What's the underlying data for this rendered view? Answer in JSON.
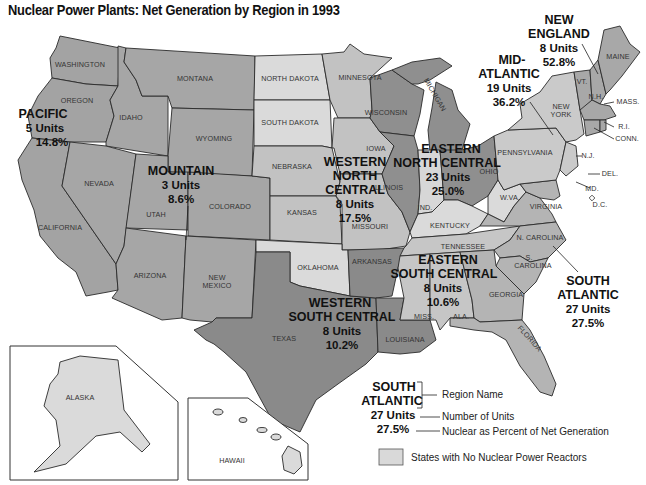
{
  "title": "Nuclear Power Plants: Net Generation by Region in 1993",
  "colors": {
    "region_dark": "#8a8a8a",
    "region_medium": "#a6a6a6",
    "region_light": "#bebebe",
    "no_reactors": "#d9d9d9",
    "border": "#2a2a2a",
    "background": "#ffffff"
  },
  "regions": [
    {
      "name": "PACIFIC",
      "units": "5 Units",
      "percent": "14.8%"
    },
    {
      "name": "MOUNTAIN",
      "units": "3 Units",
      "percent": "8.6%"
    },
    {
      "name_lines": [
        "WESTERN",
        "NORTH",
        "CENTRAL"
      ],
      "units": "8 Units",
      "percent": "17.5%"
    },
    {
      "name_lines": [
        "WESTERN",
        "SOUTH  CENTRAL"
      ],
      "units": "8 Units",
      "percent": "10.2%"
    },
    {
      "name_lines": [
        "EASTERN",
        "NORTH CENTRAL"
      ],
      "units": "23 Units",
      "percent": "25.0%"
    },
    {
      "name_lines": [
        "EASTERN",
        "SOUTH CENTRAL"
      ],
      "units": "8 Units",
      "percent": "10.6%"
    },
    {
      "name_lines": [
        "SOUTH",
        "ATLANTIC"
      ],
      "units": "27 Units",
      "percent": "27.5%"
    },
    {
      "name_lines": [
        "MID-",
        "ATLANTIC"
      ],
      "units": "19 Units",
      "percent": "36.2%"
    },
    {
      "name_lines": [
        "NEW",
        "ENGLAND"
      ],
      "units": "8 Units",
      "percent": "52.8%"
    }
  ],
  "states": {
    "washington": "WASHINGTON",
    "oregon": "OREGON",
    "california": "CALIFORNIA",
    "idaho": "IDAHO",
    "nevada": "NEVADA",
    "montana": "MONTANA",
    "wyoming": "WYOMING",
    "utah": "UTAH",
    "colorado": "COLORADO",
    "arizona": "ARIZONA",
    "new_mexico_1": "NEW",
    "new_mexico_2": "MEXICO",
    "north_dakota": "NORTH DAKOTA",
    "south_dakota": "SOUTH DAKOTA",
    "nebraska": "NEBRASKA",
    "kansas": "KANSAS",
    "oklahoma": "OKLAHOMA",
    "texas": "TEXAS",
    "minnesota": "MINNESOTA",
    "iowa": "IOWA",
    "missouri": "MISSOURI",
    "arkansas": "ARKANSAS",
    "louisiana": "LOUISIANA",
    "wisconsin": "WISCONSIN",
    "michigan": "MICHIGAN",
    "illinois": "ILLINOIS",
    "indiana": "IND.",
    "ohio": "OHIO",
    "kentucky": "KENTUCKY",
    "tennessee": "TENNESSEE",
    "mississippi": "MISS.",
    "alabama": "ALA.",
    "georgia": "GEORGIA",
    "florida": "FLORIDA",
    "south_carolina_1": "S.",
    "south_carolina_2": "CAROLINA",
    "north_carolina": "N. CAROLINA",
    "virginia": "VIRGINIA",
    "west_virginia": "W.VA.",
    "pennsylvania": "PENNSYLVANIA",
    "new_york_1": "NEW",
    "new_york_2": "YORK",
    "new_jersey": "N.J.",
    "delaware": "DEL.",
    "maryland": "MD.",
    "dc": "D.C.",
    "vermont": "VT.",
    "new_hampshire": "N.H.",
    "maine": "MAINE",
    "massachusetts": "MASS.",
    "rhode_island": "R.I.",
    "connecticut": "CONN.",
    "alaska": "ALASKA",
    "hawaii": "HAWAII"
  },
  "legend": {
    "example_name_1": "SOUTH",
    "example_name_2": "ATLANTIC",
    "example_units": "27 Units",
    "example_percent": "27.5%",
    "region_name_label": "Region Name",
    "units_label": "Number of Units",
    "percent_label": "Nuclear as Percent of Net Generation",
    "no_reactors_label": "States with No Nuclear Power Reactors"
  }
}
